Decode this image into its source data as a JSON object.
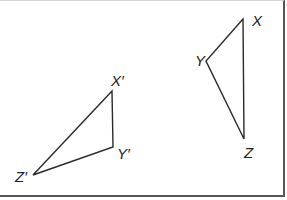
{
  "diagram": {
    "type": "geometry-transformation",
    "line_color": "#2a2a2a",
    "border_color": "#555555",
    "triangles": [
      {
        "name": "original",
        "vertices": [
          {
            "label": "X",
            "x": 243,
            "y": 19
          },
          {
            "label": "Y",
            "x": 206,
            "y": 61
          },
          {
            "label": "Z",
            "x": 244,
            "y": 139
          }
        ]
      },
      {
        "name": "image",
        "vertices": [
          {
            "label": "X′",
            "x": 112,
            "y": 91
          },
          {
            "label": "Y′",
            "x": 113,
            "y": 147
          },
          {
            "label": "Z′",
            "x": 33,
            "y": 175
          }
        ]
      }
    ],
    "labels": {
      "x": "X",
      "y": "Y",
      "z": "Z",
      "x_prime": "X′",
      "y_prime": "Y′",
      "z_prime": "Z′"
    }
  }
}
